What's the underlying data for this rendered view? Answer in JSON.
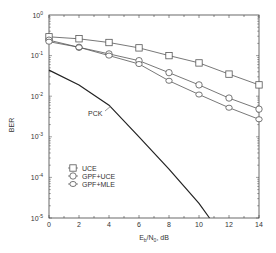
{
  "chart_data": {
    "type": "line",
    "title": "",
    "xlabel": "Eb/N0, dB",
    "xlabel_parts": {
      "main": "E",
      "sub1": "b",
      "mid": "/N",
      "sub2": "0",
      "tail": ", dB"
    },
    "ylabel": "BER",
    "xlim": [
      0,
      14
    ],
    "ylim": [
      1e-05,
      1
    ],
    "yscale": "log",
    "grid": false,
    "x_ticks": [
      0,
      2,
      4,
      6,
      8,
      10,
      12,
      14
    ],
    "x_tick_labels": [
      "0",
      "2",
      "4",
      "6",
      "8",
      "10",
      "12",
      "14"
    ],
    "y_ticks": [
      1,
      0.1,
      0.01,
      0.001,
      0.0001,
      1e-05
    ],
    "y_tick_labels": [
      {
        "base": "10",
        "exp": "0"
      },
      {
        "base": "10",
        "exp": "-1"
      },
      {
        "base": "10",
        "exp": "-2"
      },
      {
        "base": "10",
        "exp": "-3"
      },
      {
        "base": "10",
        "exp": "-4"
      },
      {
        "base": "10",
        "exp": "-5"
      }
    ],
    "legend_position": "lower-left inside",
    "series": [
      {
        "name": "UCE",
        "marker": "square",
        "x": [
          0,
          2,
          4,
          6,
          8,
          10,
          12,
          14
        ],
        "values": [
          0.29,
          0.26,
          0.21,
          0.155,
          0.1,
          0.066,
          0.035,
          0.019
        ]
      },
      {
        "name": "GPF+UCE",
        "marker": "circle",
        "x": [
          0,
          2,
          4,
          6,
          8,
          10,
          12,
          14
        ],
        "values": [
          0.24,
          0.16,
          0.11,
          0.075,
          0.038,
          0.019,
          0.009,
          0.0048
        ]
      },
      {
        "name": "GPF+MLE",
        "marker": "diamond",
        "x": [
          0,
          2,
          4,
          6,
          8,
          10,
          12,
          14
        ],
        "values": [
          0.22,
          0.16,
          0.1,
          0.062,
          0.024,
          0.011,
          0.0052,
          0.0027
        ]
      },
      {
        "name": "PCK",
        "marker": "none",
        "x": [
          0,
          2,
          4,
          6,
          8,
          10,
          10.7
        ],
        "values": [
          0.044,
          0.019,
          0.006,
          0.001,
          0.00016,
          2.3e-05,
          1e-05
        ]
      }
    ],
    "annotations": [
      {
        "text": "PCK",
        "x": 5.8,
        "y": 0.001
      }
    ]
  },
  "legend": {
    "items": [
      {
        "label": "UCE",
        "marker": "square"
      },
      {
        "label": "GPF+UCE",
        "marker": "circle"
      },
      {
        "label": "GPF+MLE",
        "marker": "diamond"
      }
    ]
  },
  "colors": {
    "line": "#555555",
    "pck_line": "#222222",
    "axis": "#444444",
    "text": "#333333"
  }
}
